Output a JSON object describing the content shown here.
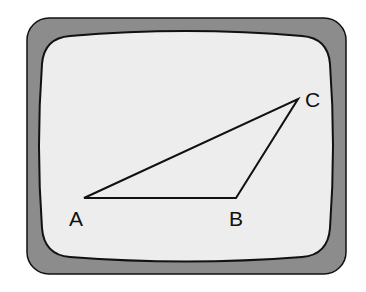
{
  "diagram": {
    "colors": {
      "bezel": "#8c8c8c",
      "screen": "#ededed",
      "stroke": "#111111"
    },
    "vertices": [
      {
        "label": "A",
        "x": 84,
        "y": 198
      },
      {
        "label": "B",
        "x": 236,
        "y": 198
      },
      {
        "label": "C",
        "x": 298,
        "y": 99
      }
    ]
  }
}
